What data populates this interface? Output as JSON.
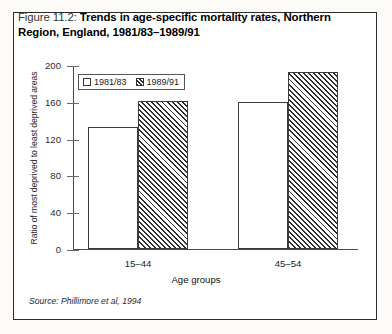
{
  "figure": {
    "label": "Figure 11.2:",
    "title": "Trends in age-specific mortality rates, Northern Region, England, 1981/83–1989/91",
    "source": "Source: Phillimore et al, 1994"
  },
  "chart_data": {
    "type": "bar",
    "title": "Trends in age-specific mortality rates, Northern Region, England, 1981/83–1989/91",
    "categories": [
      "15–44",
      "45–54"
    ],
    "series": [
      {
        "name": "1981/83",
        "values": [
          132,
          160
        ],
        "fill": "white"
      },
      {
        "name": "1989/91",
        "values": [
          161,
          192
        ],
        "fill": "diagonal-hatch"
      }
    ],
    "xlabel": "Age groups",
    "ylabel": "Ratio of most deprived to least deprived areas",
    "ylim": [
      0,
      200
    ],
    "yticks": [
      0,
      40,
      80,
      120,
      160,
      200
    ],
    "ytick_labels": [
      "0",
      "40",
      "80",
      "120",
      "160",
      "200"
    ],
    "grid": false,
    "legend_position": "top-left-inside"
  },
  "colors": {
    "axis": "#4a4a4a",
    "bar_outline": "#3a3a3a",
    "hatch": "#2e2e2e",
    "frame": "#2b2b2b",
    "text": "#1a1a1a"
  }
}
